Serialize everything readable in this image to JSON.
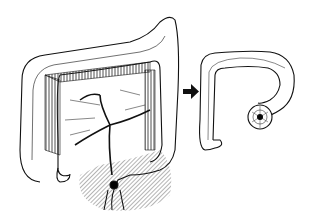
{
  "figure": {
    "colors": {
      "line": "#111111",
      "background": "#ffffff",
      "hatch": "#444444"
    },
    "left_panel": {
      "label": "colon-before-resection"
    },
    "arrow": {
      "direction": "right"
    },
    "right_panel": {
      "label": "colon-after-resection"
    }
  }
}
